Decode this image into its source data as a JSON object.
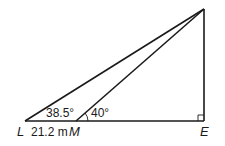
{
  "diagram": {
    "type": "geometry-triangles",
    "points": {
      "L": "L",
      "M": "M",
      "E": "E"
    },
    "labels": {
      "angle_L": "38.5°",
      "angle_M": "40°",
      "segment_LM": "21.2 m"
    },
    "right_angle_at": "E",
    "colors": {
      "stroke": "#1a1a1a",
      "background": "#ffffff"
    }
  }
}
